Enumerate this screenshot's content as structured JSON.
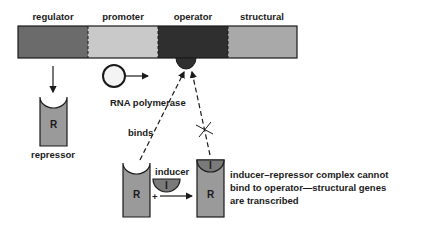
{
  "diagram": {
    "gene_segments": [
      {
        "label": "regulator",
        "color": "#6b6b6b"
      },
      {
        "label": "promoter",
        "color": "#c9c9c9"
      },
      {
        "label": "operator",
        "color": "#2f2f2f"
      },
      {
        "label": "structural",
        "color": "#a9a9a9"
      }
    ],
    "rna_polymerase_label": "RNA polymerase",
    "repressor_label": "repressor",
    "repressor_symbol": "R",
    "binds_label": "binds",
    "inducer_label": "inducer",
    "inducer_symbol": "I",
    "plus_sign": "+",
    "caption_lines": [
      "inducer–repressor complex cannot",
      "bind to operator—structural genes",
      "are transcribed"
    ],
    "colors": {
      "repressor_body": "#9a9a9a",
      "inducer": "#7a7a7a",
      "outline": "#1a1a1a"
    }
  }
}
